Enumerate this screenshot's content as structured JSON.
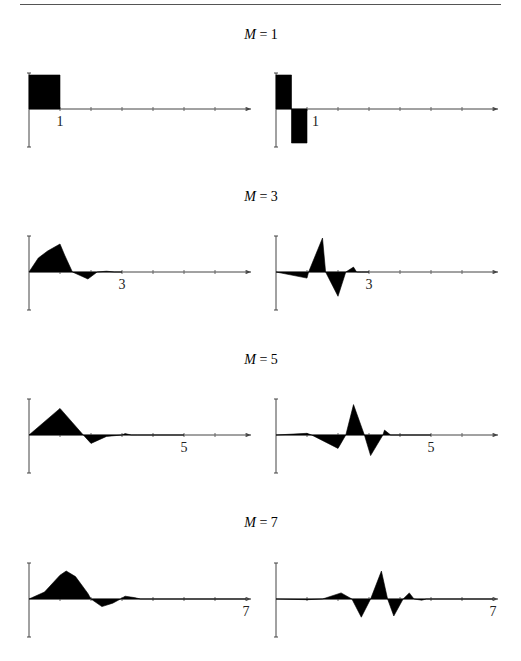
{
  "figure": {
    "panels_title_prefix": "M",
    "rows": [
      {
        "label": "M = 1",
        "m_var": "M",
        "m_val": "1",
        "tick_label": "1"
      },
      {
        "label": "M = 3",
        "m_var": "M",
        "m_val": "3",
        "tick_label": "3"
      },
      {
        "label": "M = 5",
        "m_var": "M",
        "m_val": "5",
        "tick_label": "5"
      },
      {
        "label": "M = 7",
        "m_var": "M",
        "m_val": "7",
        "tick_label": "7"
      }
    ]
  },
  "chart_data": [
    {
      "type": "area",
      "title": "M = 1 (scaling function)",
      "x_ticks": [
        0,
        1,
        2,
        3,
        4,
        5,
        6,
        7
      ],
      "labeled_tick": "1",
      "xlim": [
        0,
        7.2
      ],
      "ylim": [
        -1.2,
        1.2
      ],
      "x": [
        0,
        0,
        1,
        1
      ],
      "y": [
        0,
        1,
        1,
        0
      ]
    },
    {
      "type": "area",
      "title": "M = 1 (wavelet)",
      "x_ticks": [
        0,
        1,
        2,
        3,
        4,
        5,
        6,
        7
      ],
      "labeled_tick": "1",
      "xlim": [
        0,
        7.2
      ],
      "ylim": [
        -1.2,
        1.2
      ],
      "x": [
        0,
        0,
        0.5,
        0.5,
        1,
        1
      ],
      "y": [
        0,
        1,
        1,
        -1,
        -1,
        0
      ]
    },
    {
      "type": "area",
      "title": "M = 3 (scaling function)",
      "x_ticks": [
        0,
        1,
        2,
        3,
        4,
        5,
        6,
        7
      ],
      "labeled_tick": "3",
      "xlim": [
        0,
        7.2
      ],
      "ylim": [
        -1.5,
        1.5
      ],
      "x": [
        0,
        0.3,
        0.6,
        1.0,
        1.15,
        1.4,
        1.9,
        2.2,
        2.5,
        2.75,
        3.0
      ],
      "y": [
        0,
        0.5,
        0.75,
        1.0,
        0.6,
        0.0,
        -0.25,
        0.0,
        0.03,
        0.0,
        0.0
      ]
    },
    {
      "type": "area",
      "title": "M = 3 (wavelet)",
      "x_ticks": [
        0,
        1,
        2,
        3,
        4,
        5,
        6,
        7
      ],
      "labeled_tick": "3",
      "xlim": [
        0,
        7.2
      ],
      "ylim": [
        -1.8,
        1.8
      ],
      "x": [
        0,
        1.0,
        1.05,
        1.5,
        1.6,
        2.0,
        2.25,
        2.5,
        2.6,
        2.75,
        3.0
      ],
      "y": [
        0,
        -0.25,
        0.0,
        1.4,
        0.0,
        -1.0,
        0.0,
        0.2,
        0.0,
        0.0,
        0.0
      ]
    },
    {
      "type": "area",
      "title": "M = 5 (scaling function)",
      "x_ticks": [
        0,
        1,
        2,
        3,
        4,
        5,
        6,
        7
      ],
      "labeled_tick": "5",
      "xlim": [
        0,
        7.2
      ],
      "ylim": [
        -1.5,
        1.5
      ],
      "x": [
        0,
        1.0,
        1.75,
        2.0,
        2.5,
        3.0,
        3.1,
        3.3,
        3.5,
        5.0
      ],
      "y": [
        0,
        0.95,
        0.0,
        -0.3,
        -0.05,
        0.0,
        0.05,
        0.0,
        0.0,
        0.0
      ]
    },
    {
      "type": "area",
      "title": "M = 5 (wavelet)",
      "x_ticks": [
        0,
        1,
        2,
        3,
        4,
        5,
        6,
        7
      ],
      "labeled_tick": "5",
      "xlim": [
        0,
        7.2
      ],
      "ylim": [
        -1.8,
        1.8
      ],
      "x": [
        0,
        1.0,
        1.15,
        2.0,
        2.25,
        2.5,
        2.85,
        3.05,
        3.45,
        3.5,
        3.7,
        4.0,
        5.0
      ],
      "y": [
        0,
        0.07,
        0.0,
        -0.55,
        0.0,
        1.25,
        0.0,
        -0.85,
        0.0,
        0.2,
        0.0,
        0.0,
        0.0
      ]
    },
    {
      "type": "area",
      "title": "M = 7 (scaling function)",
      "x_ticks": [
        0,
        1,
        2,
        3,
        4,
        5,
        6,
        7
      ],
      "labeled_tick": "7",
      "xlim": [
        0,
        7.2
      ],
      "ylim": [
        -1.5,
        1.5
      ],
      "x": [
        0,
        0.5,
        1.0,
        1.2,
        1.5,
        1.9,
        2.0,
        2.35,
        2.7,
        2.95,
        3.1,
        3.4,
        3.6,
        7.0
      ],
      "y": [
        0,
        0.25,
        0.85,
        1.0,
        0.8,
        0.2,
        0.0,
        -0.27,
        -0.15,
        0.0,
        0.1,
        0.05,
        0.0,
        0.0
      ]
    },
    {
      "type": "area",
      "title": "M = 7 (wavelet)",
      "x_ticks": [
        0,
        1,
        2,
        3,
        4,
        5,
        6,
        7
      ],
      "labeled_tick": "7",
      "xlim": [
        0,
        7.2
      ],
      "ylim": [
        -1.8,
        1.8
      ],
      "x": [
        0,
        1.0,
        1.5,
        2.1,
        2.45,
        2.75,
        3.05,
        3.4,
        3.6,
        3.8,
        4.1,
        4.3,
        4.45,
        4.7,
        4.85,
        5.0,
        7.0
      ],
      "y": [
        0,
        -0.03,
        0.0,
        0.25,
        0.0,
        -0.75,
        0.0,
        1.15,
        0.0,
        -0.7,
        0.0,
        0.25,
        0.0,
        -0.05,
        0.0,
        0.0,
        0.0
      ]
    }
  ]
}
